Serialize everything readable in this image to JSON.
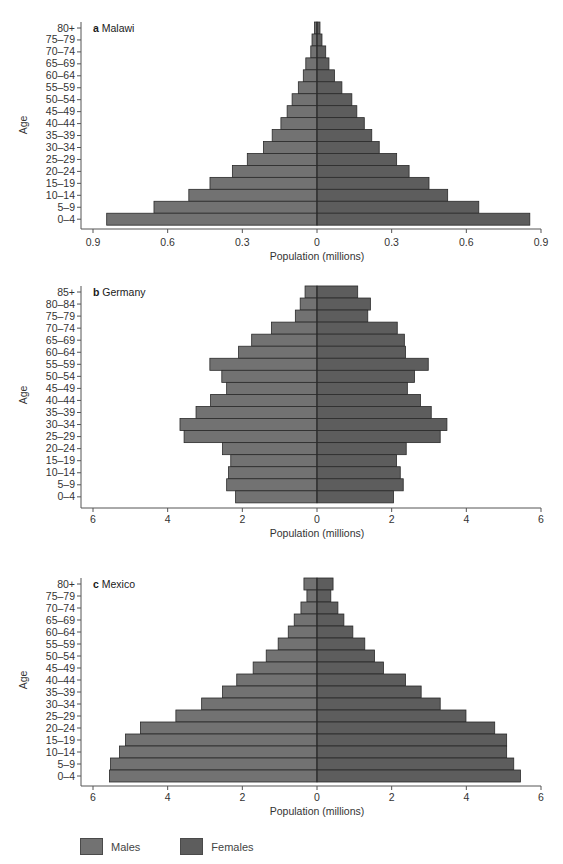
{
  "figure": {
    "y_axis_title": "Age",
    "x_axis_title": "Population (millions)"
  },
  "legend": {
    "items": [
      {
        "label": "Males",
        "color": "#727272"
      },
      {
        "label": "Females",
        "color": "#5d5d5d"
      }
    ]
  },
  "chart_data": [
    {
      "type": "bar",
      "subtype": "population-pyramid",
      "panel_letter": "a",
      "title": "Malawi",
      "xlabel": "Population (millions)",
      "ylabel": "Age",
      "xlim": [
        -0.9,
        0.9
      ],
      "xticks": [
        -0.9,
        -0.6,
        -0.3,
        0,
        0.3,
        0.6,
        0.9
      ],
      "xtick_labels": [
        "0.9",
        "0.6",
        "0.3",
        "0",
        "0.3",
        "0.6",
        "0.9"
      ],
      "grid": false,
      "categories": [
        "80+",
        "75–79",
        "70–74",
        "65–69",
        "60–64",
        "55–59",
        "50–54",
        "45–49",
        "40–44",
        "35–39",
        "30–34",
        "25–29",
        "20–24",
        "15–19",
        "10–14",
        "5–9",
        "0–4"
      ],
      "series": [
        {
          "name": "Males",
          "values": [
            0.01,
            0.02,
            0.025,
            0.045,
            0.055,
            0.075,
            0.1,
            0.12,
            0.145,
            0.18,
            0.215,
            0.28,
            0.34,
            0.43,
            0.515,
            0.655,
            0.845
          ]
        },
        {
          "name": "Females",
          "values": [
            0.012,
            0.02,
            0.035,
            0.048,
            0.07,
            0.1,
            0.14,
            0.16,
            0.19,
            0.22,
            0.25,
            0.32,
            0.37,
            0.45,
            0.525,
            0.65,
            0.855
          ]
        }
      ]
    },
    {
      "type": "bar",
      "subtype": "population-pyramid",
      "panel_letter": "b",
      "title": "Germany",
      "xlabel": "Population (millions)",
      "ylabel": "Age",
      "xlim": [
        -6,
        6
      ],
      "xticks": [
        -6,
        -4,
        -2,
        0,
        2,
        4,
        6
      ],
      "xtick_labels": [
        "6",
        "4",
        "2",
        "0",
        "2",
        "4",
        "6"
      ],
      "grid": false,
      "categories": [
        "85+",
        "80–84",
        "75–79",
        "70–74",
        "65–69",
        "60–64",
        "55–59",
        "50–54",
        "45–49",
        "40–44",
        "35–39",
        "30–34",
        "25–29",
        "20–24",
        "15–19",
        "10–14",
        "5–9",
        "0–4"
      ],
      "series": [
        {
          "name": "Males",
          "values": [
            0.32,
            0.45,
            0.58,
            1.22,
            1.75,
            2.1,
            2.87,
            2.55,
            2.42,
            2.85,
            3.24,
            3.67,
            3.56,
            2.53,
            2.31,
            2.37,
            2.42,
            2.18
          ]
        },
        {
          "name": "Females",
          "values": [
            1.09,
            1.43,
            1.36,
            2.15,
            2.34,
            2.37,
            2.98,
            2.61,
            2.42,
            2.77,
            3.06,
            3.48,
            3.3,
            2.39,
            2.13,
            2.23,
            2.31,
            2.05
          ]
        }
      ]
    },
    {
      "type": "bar",
      "subtype": "population-pyramid",
      "panel_letter": "c",
      "title": "Mexico",
      "xlabel": "Population (millions)",
      "ylabel": "Age",
      "xlim": [
        -6,
        6
      ],
      "xticks": [
        -6,
        -4,
        -2,
        0,
        2,
        4,
        6
      ],
      "xtick_labels": [
        "6",
        "4",
        "2",
        "0",
        "2",
        "4",
        "6"
      ],
      "grid": false,
      "categories": [
        "80+",
        "75–79",
        "70–74",
        "65–69",
        "60–64",
        "55–59",
        "50–54",
        "45–49",
        "40–44",
        "35–39",
        "30–34",
        "25–29",
        "20–24",
        "15–19",
        "10–14",
        "5–9",
        "0–4"
      ],
      "series": [
        {
          "name": "Males",
          "values": [
            0.35,
            0.27,
            0.43,
            0.61,
            0.77,
            1.04,
            1.36,
            1.71,
            2.15,
            2.53,
            3.09,
            3.78,
            4.73,
            5.13,
            5.29,
            5.53,
            5.56
          ]
        },
        {
          "name": "Females",
          "values": [
            0.43,
            0.37,
            0.56,
            0.72,
            0.96,
            1.28,
            1.54,
            1.78,
            2.37,
            2.79,
            3.3,
            3.99,
            4.76,
            5.08,
            5.08,
            5.27,
            5.45
          ]
        }
      ]
    }
  ]
}
